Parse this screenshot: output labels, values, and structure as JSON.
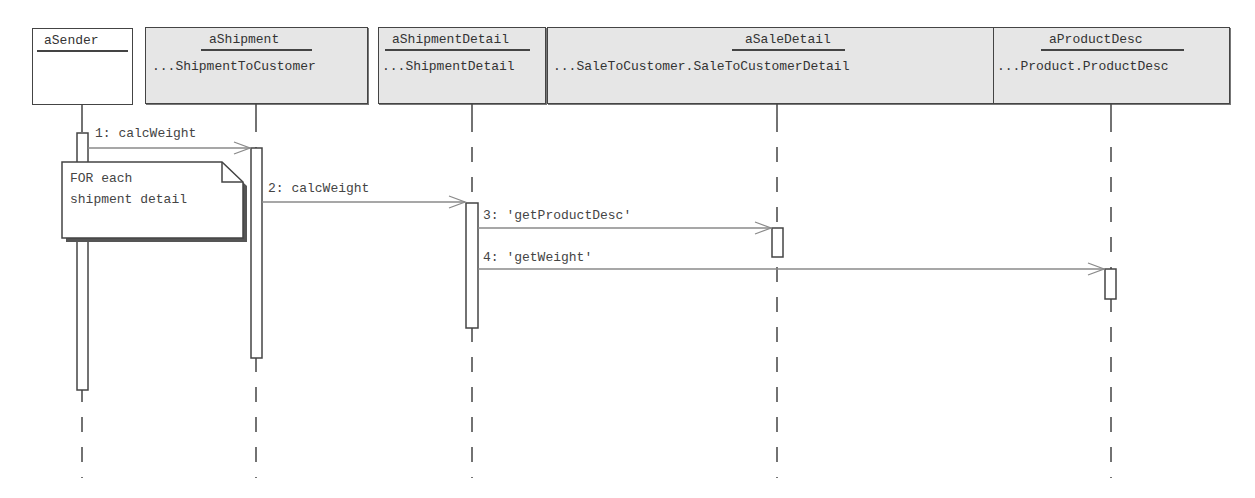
{
  "diagram": {
    "type": "UML sequence diagram",
    "colors": {
      "object_fill": "#e6e6e6",
      "actor_fill": "#ffffff",
      "line": "#444444",
      "message_line": "#8a8a8a"
    },
    "objects": [
      {
        "id": "aSender",
        "name": "aSender",
        "class": "",
        "fill": "white"
      },
      {
        "id": "aShipment",
        "name": "aShipment",
        "class": "...ShipmentToCustomer",
        "fill": "gray"
      },
      {
        "id": "aShipmentDetail",
        "name": "aShipmentDetail",
        "class": "...ShipmentDetail",
        "fill": "gray"
      },
      {
        "id": "aSaleDetail",
        "name": "aSaleDetail",
        "class": "...SaleToCustomer.SaleToCustomerDetail",
        "fill": "gray"
      },
      {
        "id": "aProductDesc",
        "name": "aProductDesc",
        "class": "...Product.ProductDesc",
        "fill": "gray"
      }
    ],
    "messages": [
      {
        "label": "1: calcWeight",
        "from": "aSender",
        "to": "aShipment"
      },
      {
        "label": "2: calcWeight",
        "from": "aShipment",
        "to": "aShipmentDetail"
      },
      {
        "label": "3: 'getProductDesc'",
        "from": "aShipmentDetail",
        "to": "aSaleDetail"
      },
      {
        "label": "4: 'getWeight'",
        "from": "aShipmentDetail",
        "to": "aProductDesc"
      }
    ],
    "note": {
      "lines": [
        "FOR each",
        "shipment detail"
      ]
    }
  }
}
